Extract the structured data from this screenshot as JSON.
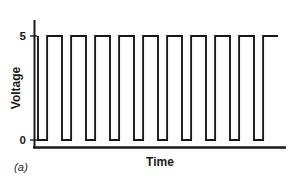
{
  "figure": {
    "caption": "(a)",
    "line_color": "#181818",
    "axis_color": "#1a1a1a",
    "background": "#ffffff"
  },
  "chart_data": {
    "type": "line",
    "title": "",
    "subtitle": "",
    "xlabel": "Time",
    "ylabel": "Voltage",
    "grid": false,
    "legend": null,
    "ylim": [
      0,
      5
    ],
    "y_ticks": [
      0,
      5
    ],
    "y_tick_labels": [
      "0",
      "5"
    ],
    "x_ticks": [],
    "x_tick_labels": [],
    "xlim": [
      0,
      10
    ],
    "waveform": {
      "description": "square wave pulse train, high level 5 V, low level 0 V",
      "high_value": 5,
      "low_value": 0,
      "period": 1.0,
      "duty_cycle_high": 0.62,
      "pulse_count": 10,
      "starts_high": true,
      "points": [
        [
          0.0,
          5
        ],
        [
          0.0,
          0
        ],
        [
          0.38,
          0
        ],
        [
          0.38,
          5
        ],
        [
          1.0,
          5
        ],
        [
          1.0,
          0
        ],
        [
          1.38,
          0
        ],
        [
          1.38,
          5
        ],
        [
          2.0,
          5
        ],
        [
          2.0,
          0
        ],
        [
          2.38,
          0
        ],
        [
          2.38,
          5
        ],
        [
          3.0,
          5
        ],
        [
          3.0,
          0
        ],
        [
          3.38,
          0
        ],
        [
          3.38,
          5
        ],
        [
          4.0,
          5
        ],
        [
          4.0,
          0
        ],
        [
          4.38,
          0
        ],
        [
          4.38,
          5
        ],
        [
          5.0,
          5
        ],
        [
          5.0,
          0
        ],
        [
          5.38,
          0
        ],
        [
          5.38,
          5
        ],
        [
          6.0,
          5
        ],
        [
          6.0,
          0
        ],
        [
          6.38,
          0
        ],
        [
          6.38,
          5
        ],
        [
          7.0,
          5
        ],
        [
          7.0,
          0
        ],
        [
          7.38,
          0
        ],
        [
          7.38,
          5
        ],
        [
          8.0,
          5
        ],
        [
          8.0,
          0
        ],
        [
          8.38,
          0
        ],
        [
          8.38,
          5
        ],
        [
          9.0,
          5
        ],
        [
          9.0,
          0
        ],
        [
          9.38,
          0
        ],
        [
          9.38,
          5
        ]
      ]
    }
  }
}
